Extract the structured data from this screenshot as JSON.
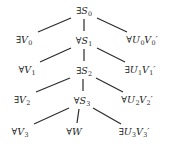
{
  "figure": {
    "type": "tree-diagram",
    "width": 169,
    "height": 150,
    "background_color": "#ffffff",
    "line_color": "#2b2b2b",
    "text_color": "#1c1c1c"
  },
  "nodes": [
    {
      "id": "s0",
      "label": "∃S₀",
      "quantifier": "∃",
      "symbol": "S",
      "sub": "0",
      "prime": false,
      "x": 84,
      "y": 11,
      "column": "center",
      "row": 0
    },
    {
      "id": "v0",
      "label": "∃V₀",
      "quantifier": "∃",
      "symbol": "V",
      "sub": "0",
      "prime": false,
      "x": 24,
      "y": 40,
      "column": "left",
      "row": 1
    },
    {
      "id": "s1",
      "label": "∀S₁",
      "quantifier": "∀",
      "symbol": "S",
      "sub": "1",
      "prime": false,
      "x": 84,
      "y": 41,
      "column": "center",
      "row": 1
    },
    {
      "id": "u0",
      "label": "∀U₀V₀′",
      "quantifier": "∀",
      "symbol": "U",
      "sub": "0",
      "prime": true,
      "x": 142,
      "y": 40,
      "column": "right",
      "row": 1
    },
    {
      "id": "v1",
      "label": "∀V₁",
      "quantifier": "∀",
      "symbol": "V",
      "sub": "1",
      "prime": false,
      "x": 27,
      "y": 70,
      "column": "left",
      "row": 2
    },
    {
      "id": "s2",
      "label": "∃S₂",
      "quantifier": "∃",
      "symbol": "S",
      "sub": "2",
      "prime": false,
      "x": 84,
      "y": 71,
      "column": "center",
      "row": 2
    },
    {
      "id": "u1",
      "label": "∃U₁V₁′",
      "quantifier": "∃",
      "symbol": "U",
      "sub": "1",
      "prime": true,
      "x": 140,
      "y": 70,
      "column": "right",
      "row": 2
    },
    {
      "id": "v2",
      "label": "∃V₂",
      "quantifier": "∃",
      "symbol": "V",
      "sub": "2",
      "prime": false,
      "x": 22,
      "y": 100,
      "column": "left",
      "row": 3
    },
    {
      "id": "s3",
      "label": "∀S₃",
      "quantifier": "∀",
      "symbol": "S",
      "sub": "3",
      "prime": false,
      "x": 82,
      "y": 101,
      "column": "center",
      "row": 3
    },
    {
      "id": "u2",
      "label": "∀U₂V₂′",
      "quantifier": "∀",
      "symbol": "U",
      "sub": "2",
      "prime": true,
      "x": 137,
      "y": 100,
      "column": "right",
      "row": 3
    },
    {
      "id": "v3",
      "label": "∀V₃",
      "quantifier": "∀",
      "symbol": "V",
      "sub": "3",
      "prime": false,
      "x": 20,
      "y": 132,
      "column": "left",
      "row": 4
    },
    {
      "id": "w",
      "label": "∀W",
      "quantifier": "∀",
      "symbol": "W",
      "sub": "",
      "prime": false,
      "x": 74,
      "y": 132,
      "column": "center",
      "row": 4
    },
    {
      "id": "u3",
      "label": "∃U₃V₃′",
      "quantifier": "∃",
      "symbol": "U",
      "sub": "3",
      "prime": true,
      "x": 134,
      "y": 132,
      "column": "right",
      "row": 4
    }
  ],
  "edges": [
    {
      "from": "s0",
      "to": "v0",
      "x1": 71,
      "y1": 18,
      "x2": 38,
      "y2": 32
    },
    {
      "from": "s0",
      "to": "s1",
      "x1": 84,
      "y1": 19,
      "x2": 84,
      "y2": 31
    },
    {
      "from": "s0",
      "to": "u0",
      "x1": 97,
      "y1": 18,
      "x2": 127,
      "y2": 32
    },
    {
      "from": "s1",
      "to": "v1",
      "x1": 71,
      "y1": 48,
      "x2": 40,
      "y2": 62
    },
    {
      "from": "s1",
      "to": "s2",
      "x1": 84,
      "y1": 49,
      "x2": 84,
      "y2": 61
    },
    {
      "from": "s1",
      "to": "u1",
      "x1": 97,
      "y1": 48,
      "x2": 125,
      "y2": 62
    },
    {
      "from": "s2",
      "to": "v2",
      "x1": 70,
      "y1": 78,
      "x2": 36,
      "y2": 92
    },
    {
      "from": "s2",
      "to": "s3",
      "x1": 83,
      "y1": 79,
      "x2": 83,
      "y2": 91
    },
    {
      "from": "s2",
      "to": "u2",
      "x1": 96,
      "y1": 78,
      "x2": 123,
      "y2": 92
    },
    {
      "from": "s3",
      "to": "v3",
      "x1": 69,
      "y1": 108,
      "x2": 34,
      "y2": 124
    },
    {
      "from": "s3",
      "to": "w",
      "x1": 79,
      "y1": 109,
      "x2": 77,
      "y2": 123
    },
    {
      "from": "s3",
      "to": "u3",
      "x1": 93,
      "y1": 108,
      "x2": 121,
      "y2": 124
    }
  ]
}
